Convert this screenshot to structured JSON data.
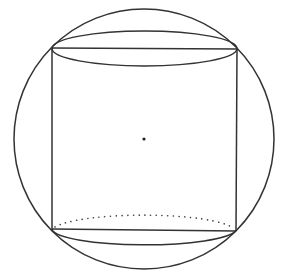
{
  "figure": {
    "width": 289,
    "height": 280,
    "stroke_color": "#333333",
    "background": "#ffffff"
  },
  "circle": {
    "cx": 144,
    "cy": 139,
    "r": 130
  },
  "center_point": {
    "x": 144,
    "y": 139,
    "r": 1.6
  },
  "cylinder": {
    "top_left": [
      52,
      48
    ],
    "top_right": [
      237,
      48
    ],
    "bottom_left": [
      52,
      230
    ],
    "bottom_right": [
      237,
      230
    ],
    "top_ellipse": {
      "cx": 144.5,
      "cy": 48,
      "rx": 92.5,
      "ry": 17.5
    },
    "bottom_ellipse": {
      "cx": 144.5,
      "cy": 230,
      "rx": 92.5,
      "ry": 16.5,
      "back_arc_style": "dotted"
    }
  }
}
